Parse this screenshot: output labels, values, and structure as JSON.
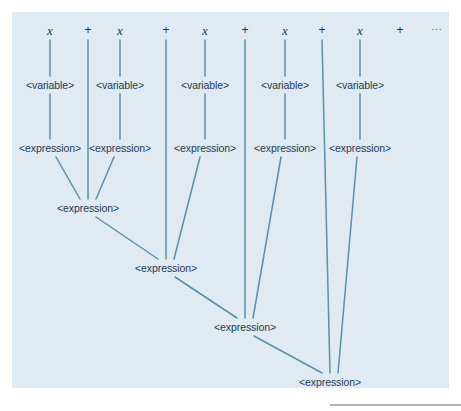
{
  "figure": {
    "kind": "parse-tree",
    "width": 461,
    "height": 411,
    "background_color": "#dfeaf2",
    "page_color": "#ffffff",
    "line_color": "#5a90a8",
    "text_color": "#1d3b52",
    "rule_color": "#9a9a9a"
  },
  "labels": {
    "variable": "<variable>",
    "expression": "<expression>",
    "x": "x",
    "plus": "+",
    "ellipsis": "⋯"
  },
  "terminals": [
    {
      "text": "x",
      "kind": "variable",
      "x": 50,
      "y": 30,
      "has_stem": true
    },
    {
      "text": "+",
      "kind": "operator",
      "x": 88,
      "y": 30,
      "has_stem": true
    },
    {
      "text": "x",
      "kind": "variable",
      "x": 120,
      "y": 30,
      "has_stem": true
    },
    {
      "text": "+",
      "kind": "operator",
      "x": 166,
      "y": 30,
      "has_stem": true
    },
    {
      "text": "x",
      "kind": "variable",
      "x": 205,
      "y": 30,
      "has_stem": true
    },
    {
      "text": "+",
      "kind": "operator",
      "x": 245,
      "y": 30,
      "has_stem": true
    },
    {
      "text": "x",
      "kind": "variable",
      "x": 285,
      "y": 30,
      "has_stem": true
    },
    {
      "text": "+",
      "kind": "operator",
      "x": 322,
      "y": 30,
      "has_stem": true
    },
    {
      "text": "x",
      "kind": "variable",
      "x": 360,
      "y": 30,
      "has_stem": true
    },
    {
      "text": "+",
      "kind": "operator",
      "x": 400,
      "y": 30,
      "has_stem": false
    },
    {
      "text": "⋯",
      "kind": "ellipsis",
      "x": 437,
      "y": 30,
      "has_stem": false
    }
  ],
  "variable_nodes": [
    {
      "text": "<variable>",
      "x": 50,
      "y": 85
    },
    {
      "text": "<variable>",
      "x": 120,
      "y": 85
    },
    {
      "text": "<variable>",
      "x": 205,
      "y": 85
    },
    {
      "text": "<variable>",
      "x": 285,
      "y": 85
    },
    {
      "text": "<variable>",
      "x": 360,
      "y": 85
    }
  ],
  "expression_nodes": [
    {
      "text": "<expression>",
      "x": 50,
      "y": 148,
      "level": 1
    },
    {
      "text": "<expression>",
      "x": 120,
      "y": 148,
      "level": 1
    },
    {
      "text": "<expression>",
      "x": 205,
      "y": 148,
      "level": 1
    },
    {
      "text": "<expression>",
      "x": 285,
      "y": 148,
      "level": 1
    },
    {
      "text": "<expression>",
      "x": 360,
      "y": 148,
      "level": 1
    },
    {
      "text": "<expression>",
      "x": 88,
      "y": 208,
      "level": 2
    },
    {
      "text": "<expression>",
      "x": 166,
      "y": 268,
      "level": 3
    },
    {
      "text": "<expression>",
      "x": 245,
      "y": 327,
      "level": 4
    },
    {
      "text": "<expression>",
      "x": 330,
      "y": 382,
      "level": 5
    }
  ],
  "edges": [
    {
      "from": "x-1",
      "to": "variable-1",
      "x1": 50,
      "y1": 40,
      "x2": 50,
      "y2": 76
    },
    {
      "from": "x-2",
      "to": "variable-2",
      "x1": 120,
      "y1": 40,
      "x2": 120,
      "y2": 76
    },
    {
      "from": "x-3",
      "to": "variable-3",
      "x1": 205,
      "y1": 40,
      "x2": 205,
      "y2": 76
    },
    {
      "from": "x-4",
      "to": "variable-4",
      "x1": 285,
      "y1": 40,
      "x2": 285,
      "y2": 76
    },
    {
      "from": "x-5",
      "to": "variable-5",
      "x1": 360,
      "y1": 40,
      "x2": 360,
      "y2": 76
    },
    {
      "from": "variable-1",
      "to": "expression-1",
      "x1": 50,
      "y1": 94,
      "x2": 50,
      "y2": 139
    },
    {
      "from": "variable-2",
      "to": "expression-2",
      "x1": 120,
      "y1": 94,
      "x2": 120,
      "y2": 139
    },
    {
      "from": "variable-3",
      "to": "expression-3",
      "x1": 205,
      "y1": 94,
      "x2": 205,
      "y2": 139
    },
    {
      "from": "variable-4",
      "to": "expression-4",
      "x1": 285,
      "y1": 94,
      "x2": 285,
      "y2": 139
    },
    {
      "from": "variable-5",
      "to": "expression-5",
      "x1": 360,
      "y1": 94,
      "x2": 360,
      "y2": 139
    },
    {
      "from": "plus-1",
      "to": "expression-6",
      "x1": 88,
      "y1": 40,
      "x2": 88,
      "y2": 199
    },
    {
      "from": "plus-2",
      "to": "expression-7",
      "x1": 166,
      "y1": 40,
      "x2": 166,
      "y2": 259
    },
    {
      "from": "plus-3",
      "to": "expression-8",
      "x1": 245,
      "y1": 40,
      "x2": 245,
      "y2": 318
    },
    {
      "from": "plus-4",
      "to": "expression-9",
      "x1": 322,
      "y1": 40,
      "x2": 330,
      "y2": 373
    },
    {
      "from": "expression-1",
      "to": "expression-6",
      "x1": 56,
      "y1": 157,
      "x2": 80,
      "y2": 199
    },
    {
      "from": "expression-2",
      "to": "expression-6",
      "x1": 114,
      "y1": 157,
      "x2": 96,
      "y2": 199
    },
    {
      "from": "expression-6",
      "to": "expression-7",
      "x1": 96,
      "y1": 217,
      "x2": 158,
      "y2": 259
    },
    {
      "from": "expression-3",
      "to": "expression-7",
      "x1": 200,
      "y1": 157,
      "x2": 174,
      "y2": 259
    },
    {
      "from": "expression-7",
      "to": "expression-8",
      "x1": 175,
      "y1": 277,
      "x2": 237,
      "y2": 318
    },
    {
      "from": "expression-4",
      "to": "expression-8",
      "x1": 281,
      "y1": 157,
      "x2": 253,
      "y2": 318
    },
    {
      "from": "expression-8",
      "to": "expression-9",
      "x1": 254,
      "y1": 336,
      "x2": 322,
      "y2": 373
    },
    {
      "from": "expression-5",
      "to": "expression-9",
      "x1": 357,
      "y1": 157,
      "x2": 338,
      "y2": 373
    }
  ]
}
